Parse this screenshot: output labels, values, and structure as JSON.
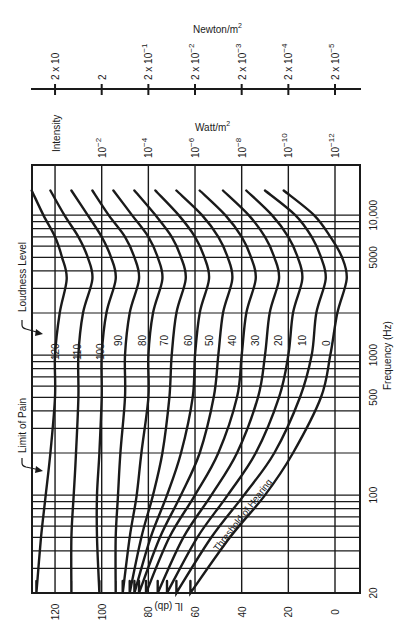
{
  "chart_data": {
    "type": "line",
    "orientation": "rotated-90-clockwise",
    "xlabel": "Frequency (Hz)",
    "ylabel": "IL (db)",
    "x_scale": "log",
    "xlim": [
      20,
      15000
    ],
    "ylim": [
      0,
      130
    ],
    "x_ticks": [
      {
        "value": 20,
        "label": "20"
      },
      {
        "value": 100,
        "label": "100"
      },
      {
        "value": 500,
        "label": "500"
      },
      {
        "value": 1000,
        "label": "1000"
      },
      {
        "value": 5000,
        "label": "5000"
      },
      {
        "value": 10000,
        "label": "10,000"
      }
    ],
    "y_ticks": [
      {
        "value": 0,
        "label": "0"
      },
      {
        "value": 20,
        "label": "20"
      },
      {
        "value": 40,
        "label": "40"
      },
      {
        "value": 60,
        "label": "60"
      },
      {
        "value": 80,
        "label": "80"
      },
      {
        "value": 100,
        "label": "100"
      },
      {
        "value": 120,
        "label": "120"
      }
    ],
    "secondary_axes": [
      {
        "title": "Intensity",
        "unit": "Watt/m²",
        "ticks": [
          {
            "il": 100,
            "label": "10",
            "exp": "−2"
          },
          {
            "il": 80,
            "label": "10",
            "exp": "−4"
          },
          {
            "il": 60,
            "label": "10",
            "exp": "−6"
          },
          {
            "il": 40,
            "label": "10",
            "exp": "−8"
          },
          {
            "il": 20,
            "label": "10",
            "exp": "−10"
          },
          {
            "il": 0,
            "label": "10",
            "exp": "−12"
          }
        ]
      },
      {
        "title": "Pressure",
        "unit": "Newton/m²",
        "ticks": [
          {
            "il": 120,
            "label": "2 x 10",
            "exp": ""
          },
          {
            "il": 100,
            "label": "2",
            "exp": ""
          },
          {
            "il": 80,
            "label": "2 x 10",
            "exp": "−1"
          },
          {
            "il": 60,
            "label": "2 x 10",
            "exp": "−2"
          },
          {
            "il": 40,
            "label": "2 x 10",
            "exp": "−3"
          },
          {
            "il": 20,
            "label": "2 x 10",
            "exp": "−4"
          },
          {
            "il": 0,
            "label": "2 x 10",
            "exp": "−5"
          }
        ]
      }
    ],
    "x": [
      20,
      50,
      100,
      200,
      500,
      1000,
      2000,
      3500,
      5000,
      7000,
      10000,
      15000
    ],
    "series": [
      {
        "name": "120",
        "values": [
          128,
          126,
          124,
          122,
          120,
          120,
          118,
          115,
          117,
          120,
          125,
          130
        ]
      },
      {
        "name": "110",
        "values": [
          113,
          113,
          112,
          111,
          110,
          110,
          108,
          104,
          106,
          110,
          116,
          122
        ]
      },
      {
        "name": "100",
        "values": [
          101,
          102,
          102,
          101,
          100,
          100,
          98,
          94,
          96,
          100,
          106,
          113
        ]
      },
      {
        "name": "90",
        "values": [
          94,
          94,
          93,
          92,
          90,
          90,
          88,
          84,
          86,
          90,
          97,
          104
        ]
      },
      {
        "name": "80",
        "values": [
          91,
          88,
          85,
          83,
          80,
          80,
          78,
          74,
          76,
          80,
          87,
          95
        ]
      },
      {
        "name": "70",
        "values": [
          88,
          83,
          78,
          74,
          71,
          70,
          68,
          64,
          66,
          70,
          77,
          86
        ]
      },
      {
        "name": "60",
        "values": [
          86,
          79,
          72,
          66,
          61,
          60,
          58,
          54,
          56,
          60,
          67,
          77
        ]
      },
      {
        "name": "50",
        "values": [
          84,
          75,
          66,
          58,
          52,
          50,
          48,
          44,
          46,
          50,
          57,
          68
        ]
      },
      {
        "name": "40",
        "values": [
          81,
          71,
          60,
          50,
          42,
          40,
          38,
          34,
          36,
          40,
          47,
          58
        ]
      },
      {
        "name": "30",
        "values": [
          76,
          65,
          53,
          42,
          33,
          30,
          28,
          24,
          26,
          30,
          37,
          48
        ]
      },
      {
        "name": "20",
        "values": [
          72,
          59,
          46,
          34,
          24,
          20,
          18,
          14,
          16,
          20,
          27,
          38
        ]
      },
      {
        "name": "10",
        "values": [
          68,
          53,
          39,
          26,
          15,
          10,
          8,
          4,
          6,
          10,
          17,
          30
        ]
      }
    ],
    "annotations": [
      {
        "text": "Loudness Level",
        "target": "curve labels"
      },
      {
        "text": "Limit of Pain",
        "target": "120 curve"
      },
      {
        "text": "Threshold of Hearing",
        "target": "0 curve"
      }
    ],
    "grid": true,
    "legend": "inline curve labels"
  },
  "labels": {
    "newton_unit": "Newton/m",
    "watt_unit": "Watt/m",
    "intensity": "Intensity",
    "loudness_level": "Loudness Level",
    "limit_of_pain": "Limit of Pain",
    "threshold": "Threshold of Hearing",
    "freq_axis": "Frequency (Hz)",
    "il_axis": "IL (db)",
    "sup2": "2"
  },
  "curve_labels": [
    "120",
    "110",
    "100",
    "90",
    "80",
    "70",
    "60",
    "50",
    "40",
    "30",
    "20",
    "10",
    "0"
  ]
}
